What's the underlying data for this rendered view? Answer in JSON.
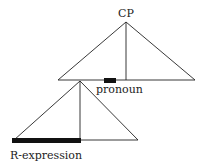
{
  "diagram": {
    "labels": {
      "root": "CP",
      "pronoun": "pronoun",
      "r_expression": "R-expression"
    },
    "colors": {
      "line": "#222222",
      "fill": "#111111",
      "background": "#ffffff"
    }
  }
}
